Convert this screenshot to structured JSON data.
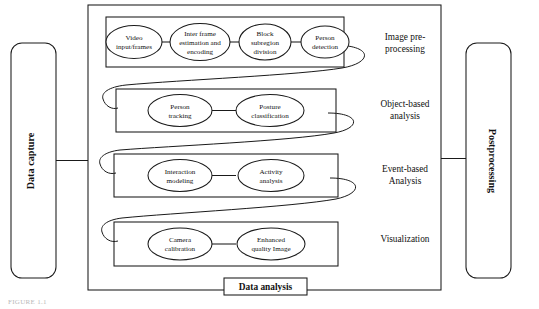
{
  "figure": {
    "caption": "FIGURE 1.1",
    "outer_container_name": "data-analysis-container"
  },
  "left_block": {
    "label": "Data capture"
  },
  "right_block": {
    "label": "Postprocessing"
  },
  "bottom_caption": {
    "label": "Data analysis"
  },
  "stage_labels": [
    {
      "id": "image-preprocessing",
      "line1": "Image pre-",
      "line2": "processing"
    },
    {
      "id": "object-based-analysis",
      "line1": "Object-based",
      "line2": "analysis"
    },
    {
      "id": "event-based-analysis",
      "line1": "Event-based",
      "line2": "Analysis"
    },
    {
      "id": "visualization",
      "line1": "Visualization",
      "line2": ""
    }
  ],
  "rows": [
    {
      "id": "row-image-preprocessing",
      "nodes": [
        {
          "id": "video-input-frames",
          "line1": "Video",
          "line2": "input/frames",
          "line3": ""
        },
        {
          "id": "inter-frame-estimation",
          "line1": "Inter frame",
          "line2": "estimation and",
          "line3": "encoding"
        },
        {
          "id": "block-subregion-division",
          "line1": "Block",
          "line2": "subregion",
          "line3": "division"
        },
        {
          "id": "person-detection",
          "line1": "Person",
          "line2": "detection",
          "line3": ""
        }
      ]
    },
    {
      "id": "row-object-based-analysis",
      "nodes": [
        {
          "id": "person-tracking",
          "line1": "Person",
          "line2": "tracking",
          "line3": ""
        },
        {
          "id": "posture-classification",
          "line1": "Posture",
          "line2": "classification",
          "line3": ""
        }
      ]
    },
    {
      "id": "row-event-based-analysis",
      "nodes": [
        {
          "id": "interaction-modeling",
          "line1": "Interaction",
          "line2": "modeling",
          "line3": ""
        },
        {
          "id": "activity-analysis",
          "line1": "Activity",
          "line2": "analysis",
          "line3": ""
        }
      ]
    },
    {
      "id": "row-visualization",
      "nodes": [
        {
          "id": "camera-calibration",
          "line1": "Camera",
          "line2": "calibration",
          "line3": ""
        },
        {
          "id": "enhanced-quality-image",
          "line1": "Enhanced",
          "line2": "quality Image",
          "line3": ""
        }
      ]
    }
  ],
  "colors": {
    "stroke": "#1a1a1a",
    "background": "#ffffff",
    "caption_text": "#b9b9b9"
  }
}
